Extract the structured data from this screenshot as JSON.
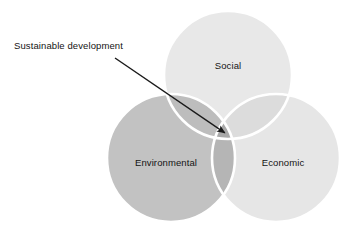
{
  "diagram": {
    "type": "venn",
    "title_annotation": {
      "text": "Sustainable development",
      "x": 14,
      "y": 40,
      "points_to": "center-overlap"
    },
    "background_color": "#ffffff",
    "circles": [
      {
        "id": "social",
        "label": "Social",
        "cx": 228,
        "cy": 75,
        "r": 64,
        "fill": "#e8e8e8",
        "stroke": "#ffffff",
        "label_x": 228,
        "label_y": 66
      },
      {
        "id": "environmental",
        "label": "Environmental",
        "cx": 171,
        "cy": 158,
        "r": 64,
        "fill": "#c2c2c2",
        "stroke": "#ffffff",
        "label_x": 166,
        "label_y": 163
      },
      {
        "id": "economic",
        "label": "Economic",
        "cx": 276,
        "cy": 158,
        "r": 64,
        "fill": "#e6e6e6",
        "stroke": "#ffffff",
        "label_x": 283,
        "label_y": 163
      }
    ],
    "overlaps": {
      "social_environmental": "#bdbdbd",
      "social_economic": "#dcdcdc",
      "environmental_economic": "#b5b5b5",
      "center": "#a8a8a8"
    },
    "arrow": {
      "color": "#1a1a1a",
      "start_x": 115,
      "start_y": 58,
      "end_x": 228,
      "end_y": 135,
      "stroke_width": 1.4,
      "head_size": 7
    }
  }
}
